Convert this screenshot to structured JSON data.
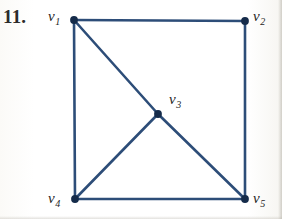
{
  "figure": {
    "problem_number": "11.",
    "type": "undirected-graph-diagram",
    "edge_color": "#2d4d78",
    "vertex_color": "#152b4a",
    "background_color": "#fefefd",
    "label_color": "#1d1d1d",
    "vertices": [
      {
        "id": "v1",
        "label_base": "v",
        "label_sub": "1",
        "x": 74,
        "y": 20,
        "label_x": 48,
        "label_y": 9,
        "name": "vertex-v1"
      },
      {
        "id": "v2",
        "label_base": "v",
        "label_sub": "2",
        "x": 245,
        "y": 21,
        "label_x": 253,
        "label_y": 9,
        "name": "vertex-v2"
      },
      {
        "id": "v3",
        "label_base": "v",
        "label_sub": "3",
        "x": 158,
        "y": 114,
        "label_x": 169,
        "label_y": 92,
        "name": "vertex-v3"
      },
      {
        "id": "v4",
        "label_base": "v",
        "label_sub": "4",
        "x": 75,
        "y": 199,
        "label_x": 48,
        "label_y": 191,
        "name": "vertex-v4"
      },
      {
        "id": "v5",
        "label_base": "v",
        "label_sub": "5",
        "x": 245,
        "y": 199,
        "label_x": 253,
        "label_y": 191,
        "name": "vertex-v5"
      }
    ],
    "edges": [
      {
        "from": "v1",
        "to": "v2",
        "name": "edge-v1-v2"
      },
      {
        "from": "v1",
        "to": "v4",
        "name": "edge-v1-v4"
      },
      {
        "from": "v2",
        "to": "v5",
        "name": "edge-v2-v5"
      },
      {
        "from": "v4",
        "to": "v5",
        "name": "edge-v4-v5"
      },
      {
        "from": "v1",
        "to": "v3",
        "name": "edge-v1-v3"
      },
      {
        "from": "v3",
        "to": "v4",
        "name": "edge-v3-v4"
      },
      {
        "from": "v3",
        "to": "v5",
        "name": "edge-v3-v5"
      }
    ]
  }
}
